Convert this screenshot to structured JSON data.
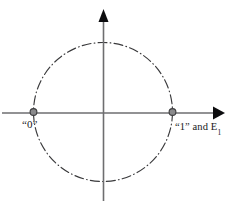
{
  "figure": {
    "background_color": "#ffffff",
    "width": 233,
    "height": 212
  },
  "axes": {
    "origin": {
      "x": 103,
      "y": 113
    },
    "horizontal": {
      "name": "horizontal-axis",
      "x_start": 2,
      "x_end": 222,
      "color": "#6e6e70",
      "arrow_end": "right"
    },
    "vertical": {
      "name": "vertical-axis",
      "y_start": 10,
      "y_end": 201,
      "color": "#6e6e70",
      "arrow_end": "top"
    },
    "arrow_color": "#0d0d0f"
  },
  "circle": {
    "name": "unit-circle",
    "center": {
      "x": 103,
      "y": 112
    },
    "radius": 69.5,
    "stroke_color": "#3a3a3c",
    "line_style": "dash-dot"
  },
  "points": [
    {
      "id": "point-zero",
      "label": "“0”",
      "label_plain": "\"0\"",
      "cx": 33.5,
      "cy": 112,
      "radius": 3.4,
      "fill": "#8a8a8c",
      "stroke": "#3c3c3e"
    },
    {
      "id": "point-one",
      "label_prefix": "“1” and E",
      "label_subscript": "1",
      "label_plain": "\"1\" and E1",
      "cx": 172.5,
      "cy": 112,
      "radius": 3.4,
      "fill": "#8a8a8c",
      "stroke": "#3c3c3e"
    }
  ]
}
